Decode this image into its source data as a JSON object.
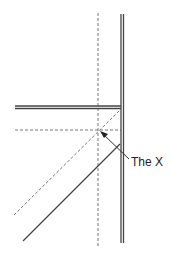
{
  "diagram": {
    "label": "The X",
    "colors": {
      "line": "#444444",
      "dashed": "#666666",
      "background": "#ffffff"
    }
  }
}
